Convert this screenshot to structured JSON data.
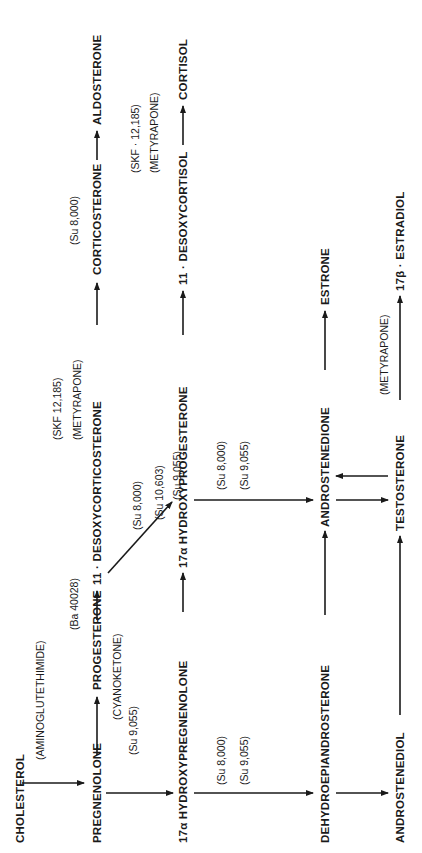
{
  "diagram": {
    "type": "steroid-biosynthesis-pathway",
    "orientation": "rotated-90-ccw",
    "compounds": {
      "cholesterol": "CHOLESTEROL",
      "pregnenolone": "PREGNENOLONE",
      "progesterone": "PROGESTERONE",
      "desoxycorticosterone": "11 · DESOXYCORTICOSTERONE",
      "corticosterone": "CORTICOSTERONE",
      "aldosterone": "ALDOSTERONE",
      "hydroxypregnenolone": "17α HYDROXYPREGNENOLONE",
      "hydroxyprogesterone": "17α HYDROXYPROGESTERONE",
      "desoxycortisol": "11 · DESOXYCORTISOL",
      "cortisol": "CORTISOL",
      "dhea": "DEHYDROEPIANDROSTERONE",
      "androstenedione": "ANDROSTENEDIONE",
      "estrone": "ESTRONE",
      "androstenediol": "ANDROSTENEDIOL",
      "testosterone": "TESTOSTERONE",
      "estradiol": "17β · ESTRADIOL"
    },
    "inhibitors": {
      "aminoglutethimide": "(AMINOGLUTETHIMIDE)",
      "cyanoketone": "(CYANOKETONE)",
      "ba40028": "(Ba 40028)",
      "skf_top": "(SKF 12,185)",
      "metyrapone_top": "(METYRAPONE)",
      "su8000_aldo": "(Su 8,000)",
      "skf_mid": "(SKF · 12,185)",
      "metyrapone_mid": "(METYRAPONE)",
      "su9055_preg": "(Su 9,055)",
      "diag_su8000": "(Su 8,000)",
      "diag_su10603": "(Su 10,603)",
      "diag_su9055": "(Su 9,055)",
      "dhea_su8000": "(Su 8,000)",
      "dhea_su9055": "(Su 9,055)",
      "andro_su8000": "(Su 8,000)",
      "andro_su9055": "(Su 9,055)",
      "metyrapone_low": "(METYRAPONE)"
    }
  }
}
